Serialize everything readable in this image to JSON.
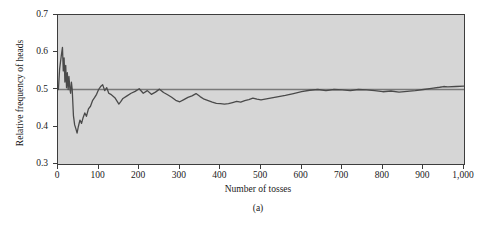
{
  "figure": {
    "caption": "(a)"
  },
  "chart_data": {
    "type": "line",
    "title": "",
    "xlabel": "Number of tosses",
    "ylabel": "Relative frequency of heads",
    "xlim": [
      0,
      1000
    ],
    "ylim": [
      0.3,
      0.7
    ],
    "grid": false,
    "legend": null,
    "xticks": [
      0,
      100,
      200,
      300,
      400,
      500,
      600,
      700,
      800,
      900,
      1000
    ],
    "xtick_labels": [
      "0",
      "100",
      "200",
      "300",
      "400",
      "500",
      "600",
      "700",
      "800",
      "900",
      "1,000"
    ],
    "yticks": [
      0.3,
      0.4,
      0.5,
      0.6,
      0.7
    ],
    "ytick_labels": [
      "0.3",
      "0.4",
      "0.5",
      "0.6",
      "0.7"
    ],
    "plot_background_color": "#d6d6d6",
    "line_color": "#4a4a4a",
    "reference_line": {
      "name": "probability of heads",
      "orientation": "horizontal",
      "value": 0.5,
      "color": "#7a7a7a"
    },
    "series": [
      {
        "name": "Relative frequency of heads",
        "color": "#4a4a4a",
        "x": [
          1,
          4,
          8,
          11,
          13,
          15,
          17,
          19,
          21,
          23,
          25,
          27,
          29,
          31,
          33,
          35,
          38,
          41,
          44,
          47,
          50,
          54,
          58,
          62,
          66,
          70,
          75,
          80,
          85,
          90,
          95,
          100,
          105,
          110,
          115,
          120,
          125,
          130,
          140,
          150,
          155,
          160,
          170,
          180,
          190,
          200,
          210,
          220,
          230,
          240,
          250,
          260,
          270,
          280,
          290,
          300,
          310,
          320,
          330,
          340,
          350,
          360,
          370,
          380,
          390,
          400,
          410,
          420,
          430,
          440,
          450,
          460,
          470,
          480,
          490,
          500,
          520,
          540,
          560,
          580,
          600,
          620,
          640,
          660,
          680,
          700,
          720,
          740,
          760,
          780,
          800,
          820,
          840,
          860,
          880,
          900,
          920,
          940,
          950,
          960,
          980,
          1000
        ],
        "y": [
          0.5,
          0.555,
          0.59,
          0.613,
          0.55,
          0.585,
          0.52,
          0.565,
          0.505,
          0.545,
          0.5,
          0.535,
          0.505,
          0.49,
          0.52,
          0.5,
          0.43,
          0.405,
          0.395,
          0.383,
          0.4,
          0.418,
          0.409,
          0.425,
          0.437,
          0.428,
          0.448,
          0.455,
          0.47,
          0.478,
          0.487,
          0.5,
          0.508,
          0.513,
          0.497,
          0.505,
          0.49,
          0.487,
          0.478,
          0.461,
          0.468,
          0.476,
          0.483,
          0.49,
          0.495,
          0.502,
          0.49,
          0.497,
          0.487,
          0.493,
          0.501,
          0.492,
          0.486,
          0.479,
          0.471,
          0.467,
          0.473,
          0.479,
          0.483,
          0.489,
          0.481,
          0.474,
          0.47,
          0.466,
          0.463,
          0.462,
          0.461,
          0.462,
          0.465,
          0.468,
          0.466,
          0.47,
          0.473,
          0.477,
          0.474,
          0.472,
          0.476,
          0.48,
          0.484,
          0.489,
          0.494,
          0.498,
          0.5,
          0.497,
          0.5,
          0.499,
          0.497,
          0.5,
          0.499,
          0.497,
          0.494,
          0.496,
          0.493,
          0.495,
          0.497,
          0.5,
          0.503,
          0.506,
          0.508,
          0.507,
          0.508,
          0.509
        ]
      }
    ]
  }
}
